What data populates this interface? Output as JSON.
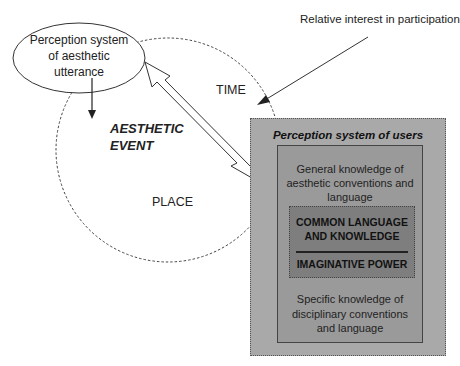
{
  "diagram": {
    "ellipse_label": "Perception system of aesthetic utterance",
    "top_right_label": "Relative interest in participation",
    "circle": {
      "time_label": "TIME",
      "event_label_line1": "AESTHETIC",
      "event_label_line2": "EVENT",
      "place_label": "PLACE"
    },
    "users_box": {
      "title": "Perception system of users",
      "general_knowledge": "General knowledge of aesthetic conventions and language",
      "core_top": "COMMON LANGUAGE AND KNOWLEDGE",
      "core_bottom": "IMAGINATIVE POWER",
      "specific_knowledge": "Specific knowledge of disciplinary conventions and language"
    },
    "colors": {
      "outer_box": "#a9a9a9",
      "inner_box": "#9a9a9a",
      "core_box": "#7e7e7e",
      "line": "#333333"
    }
  }
}
